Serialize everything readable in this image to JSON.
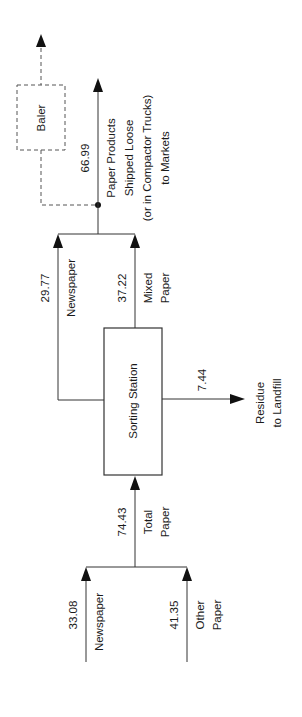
{
  "diagram": {
    "type": "process-flow",
    "orientation": "rotated-90",
    "nodes": {
      "sorting_station": "Sorting Station",
      "baler": "Baler"
    },
    "inputs": {
      "newspaper": {
        "label": "Newspaper",
        "value": "33.08"
      },
      "other_paper": {
        "label_line1": "Other",
        "label_line2": "Paper",
        "value": "41.35"
      },
      "total_paper": {
        "label_line1": "Total",
        "label_line2": "Paper",
        "value": "74.43"
      }
    },
    "outputs": {
      "newspaper": {
        "label": "Newspaper",
        "value": "29.77"
      },
      "mixed_paper": {
        "label_line1": "Mixed",
        "label_line2": "Paper",
        "value": "37.22"
      },
      "residue": {
        "label_line1": "Residue",
        "label_line2": "to Landfill",
        "value": "7.44"
      },
      "paper_products": {
        "label_line1": "Paper Products",
        "label_line2": "Shipped Loose",
        "label_line3": "(or in Compactor Trucks)",
        "label_line4": "to Markets",
        "value": "66.99"
      }
    },
    "colors": {
      "line": "#333333",
      "arrowhead": "#111111",
      "background": "#ffffff"
    }
  }
}
